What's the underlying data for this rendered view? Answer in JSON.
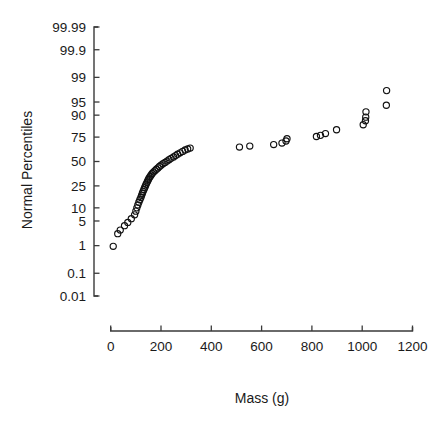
{
  "chart_data": {
    "type": "scatter",
    "title": "",
    "xlabel": "Mass (g)",
    "ylabel": "Normal Percentiles",
    "grid": false,
    "legend": false,
    "yscale": "probit",
    "xlim": [
      -40,
      1260
    ],
    "x_ticks": [
      0,
      200,
      400,
      600,
      800,
      1000,
      1200
    ],
    "x_tick_labels": [
      "0",
      "200",
      "400",
      "600",
      "800",
      "1000",
      "1200"
    ],
    "y_ticks": [
      99.99,
      99.9,
      99,
      95,
      90,
      75,
      50,
      25,
      10,
      5,
      1,
      0.1,
      0.01
    ],
    "y_tick_labels": [
      "99.99",
      "99.9",
      "99",
      "95",
      "90",
      "75",
      "50",
      "25",
      "10",
      "5",
      "1",
      "0.1",
      "0.01"
    ],
    "series": [
      {
        "name": "Mass normal probability",
        "marker": "open-circle",
        "color": "#111111",
        "points": [
          {
            "x": 10,
            "y": 0.95
          },
          {
            "x": 28,
            "y": 2.3
          },
          {
            "x": 38,
            "y": 2.9
          },
          {
            "x": 55,
            "y": 3.8
          },
          {
            "x": 68,
            "y": 4.6
          },
          {
            "x": 82,
            "y": 5.7
          },
          {
            "x": 95,
            "y": 7.0
          },
          {
            "x": 100,
            "y": 8.5
          },
          {
            "x": 104,
            "y": 10.0
          },
          {
            "x": 108,
            "y": 11.5
          },
          {
            "x": 112,
            "y": 13.0
          },
          {
            "x": 116,
            "y": 14.5
          },
          {
            "x": 120,
            "y": 16.0
          },
          {
            "x": 123,
            "y": 17.5
          },
          {
            "x": 126,
            "y": 19.0
          },
          {
            "x": 129,
            "y": 20.5
          },
          {
            "x": 132,
            "y": 22.0
          },
          {
            "x": 135,
            "y": 23.5
          },
          {
            "x": 138,
            "y": 25.0
          },
          {
            "x": 141,
            "y": 26.5
          },
          {
            "x": 144,
            "y": 28.0
          },
          {
            "x": 147,
            "y": 29.5
          },
          {
            "x": 150,
            "y": 31.0
          },
          {
            "x": 153,
            "y": 32.5
          },
          {
            "x": 157,
            "y": 34.0
          },
          {
            "x": 161,
            "y": 35.5
          },
          {
            "x": 165,
            "y": 37.0
          },
          {
            "x": 170,
            "y": 38.5
          },
          {
            "x": 176,
            "y": 40.0
          },
          {
            "x": 182,
            "y": 41.5
          },
          {
            "x": 188,
            "y": 43.0
          },
          {
            "x": 194,
            "y": 44.5
          },
          {
            "x": 200,
            "y": 46.0
          },
          {
            "x": 208,
            "y": 47.5
          },
          {
            "x": 216,
            "y": 49.0
          },
          {
            "x": 224,
            "y": 50.5
          },
          {
            "x": 232,
            "y": 52.0
          },
          {
            "x": 240,
            "y": 53.5
          },
          {
            "x": 250,
            "y": 55.0
          },
          {
            "x": 258,
            "y": 56.5
          },
          {
            "x": 266,
            "y": 58.0
          },
          {
            "x": 276,
            "y": 59.5
          },
          {
            "x": 286,
            "y": 61.0
          },
          {
            "x": 296,
            "y": 62.5
          },
          {
            "x": 306,
            "y": 63.5
          },
          {
            "x": 316,
            "y": 64.5
          },
          {
            "x": 512,
            "y": 65.5
          },
          {
            "x": 553,
            "y": 66.5
          },
          {
            "x": 648,
            "y": 68.0
          },
          {
            "x": 681,
            "y": 69.5
          },
          {
            "x": 697,
            "y": 71.5
          },
          {
            "x": 701,
            "y": 73.5
          },
          {
            "x": 818,
            "y": 75.5
          },
          {
            "x": 834,
            "y": 76.5
          },
          {
            "x": 854,
            "y": 78.0
          },
          {
            "x": 898,
            "y": 81.0
          },
          {
            "x": 1004,
            "y": 84.5
          },
          {
            "x": 1013,
            "y": 87.0
          },
          {
            "x": 1014,
            "y": 89.0
          },
          {
            "x": 1015,
            "y": 91.5
          },
          {
            "x": 1096,
            "y": 94.0
          },
          {
            "x": 1097,
            "y": 97.5
          }
        ]
      }
    ]
  },
  "axes": {
    "x_axis_name": "mass-axis",
    "y_axis_name": "percentile-axis"
  }
}
